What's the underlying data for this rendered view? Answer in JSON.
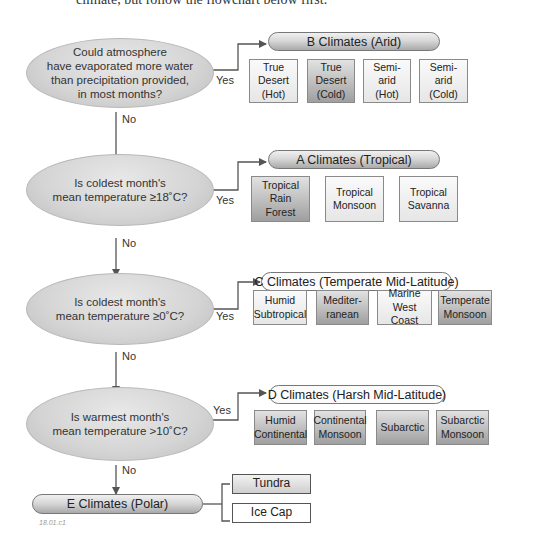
{
  "header": {
    "intro_text": "climate, but follow the flowchart below first."
  },
  "questions": [
    {
      "id": "q1",
      "text": "Could atmosphere have evaporated more water than precipitation provided, in most months?",
      "lines": [
        "Could atmosphere",
        "have evaporated more water",
        "than precipitation provided,",
        "in most months?"
      ]
    },
    {
      "id": "q2",
      "text": "Is coldest month's mean temperature ≥18˚C?",
      "lines": [
        "Is coldest month's",
        "mean temperature ≥18˚C?"
      ]
    },
    {
      "id": "q3",
      "text": "Is coldest month's mean temperature ≥0˚C?",
      "lines": [
        "Is coldest month's",
        "mean temperature ≥0˚C?"
      ]
    },
    {
      "id": "q4",
      "text": "Is warmest month's mean temperature >10˚C?",
      "lines": [
        "Is warmest month's",
        "mean temperature >10˚C?"
      ]
    }
  ],
  "edge_labels": {
    "yes": "Yes",
    "no": "No"
  },
  "groups": {
    "B": {
      "title": "B Climates (Arid)",
      "items": [
        {
          "label": [
            "True",
            "Desert",
            "(Hot)"
          ],
          "shade": "light"
        },
        {
          "label": [
            "True",
            "Desert",
            "(Cold)"
          ],
          "shade": "dark"
        },
        {
          "label": [
            "Semi-",
            "arid",
            "(Hot)"
          ],
          "shade": "light"
        },
        {
          "label": [
            "Semi-",
            "arid",
            "(Cold)"
          ],
          "shade": "light"
        }
      ]
    },
    "A": {
      "title": "A Climates (Tropical)",
      "items": [
        {
          "label": [
            "Tropical",
            "Rain",
            "Forest"
          ],
          "shade": "dark"
        },
        {
          "label": [
            "Tropical",
            "Monsoon"
          ],
          "shade": "light"
        },
        {
          "label": [
            "Tropical",
            "Savanna"
          ],
          "shade": "light"
        }
      ]
    },
    "C": {
      "title": "C Climates (Temperate Mid-Latitude)",
      "items": [
        {
          "label": [
            "Humid",
            "Subtropical"
          ],
          "shade": "light"
        },
        {
          "label": [
            "Mediter-",
            "ranean"
          ],
          "shade": "dark"
        },
        {
          "label": [
            "Marine",
            "West Coast"
          ],
          "shade": "light"
        },
        {
          "label": [
            "Temperate",
            "Monsoon"
          ],
          "shade": "dark"
        }
      ]
    },
    "D": {
      "title": "D Climates (Harsh Mid-Latitude)",
      "items": [
        {
          "label": [
            "Humid",
            "Continental"
          ],
          "shade": "dark"
        },
        {
          "label": [
            "Continental",
            "Monsoon"
          ],
          "shade": "dark"
        },
        {
          "label": [
            "Subarctic"
          ],
          "shade": "dark"
        },
        {
          "label": [
            "Subarctic",
            "Monsoon"
          ],
          "shade": "dark"
        }
      ]
    },
    "E": {
      "title": "E Climates (Polar)",
      "items": [
        {
          "label": [
            "Tundra"
          ],
          "shade": "gray"
        },
        {
          "label": [
            "Ice Cap"
          ],
          "shade": "white"
        }
      ]
    }
  },
  "figure_id": "18.01.c1",
  "colors": {
    "line": "#555555",
    "ellipse_fill": "#d4d4d4",
    "box_dark": "#b0b0b0",
    "box_light": "#ececec"
  }
}
